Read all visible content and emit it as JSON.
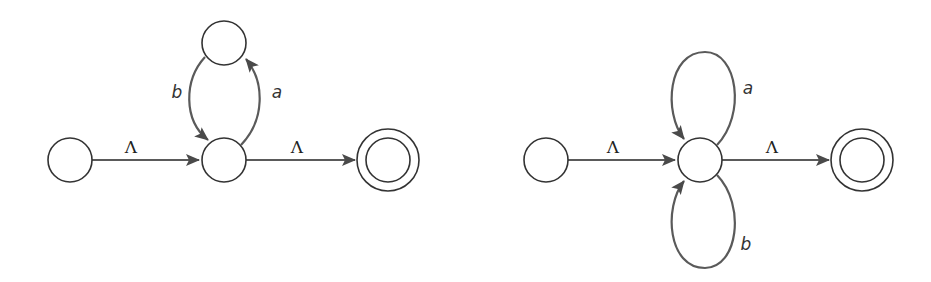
{
  "colors": {
    "state_stroke": "#333333",
    "edge_stroke": "#5a5a5a",
    "background": "#ffffff"
  },
  "diagrams": [
    {
      "name": "left-nfa",
      "states": [
        {
          "id": "start",
          "kind": "normal"
        },
        {
          "id": "middle",
          "kind": "normal"
        },
        {
          "id": "top",
          "kind": "normal"
        },
        {
          "id": "final",
          "kind": "accepting"
        }
      ],
      "edges": [
        {
          "from": "start",
          "to": "middle",
          "label": "Λ"
        },
        {
          "from": "middle",
          "to": "final",
          "label": "Λ"
        },
        {
          "from": "middle",
          "to": "top",
          "label": "a"
        },
        {
          "from": "top",
          "to": "middle",
          "label": "b"
        }
      ]
    },
    {
      "name": "right-nfa",
      "states": [
        {
          "id": "start",
          "kind": "normal"
        },
        {
          "id": "middle",
          "kind": "normal"
        },
        {
          "id": "final",
          "kind": "accepting"
        }
      ],
      "edges": [
        {
          "from": "start",
          "to": "middle",
          "label": "Λ"
        },
        {
          "from": "middle",
          "to": "final",
          "label": "Λ"
        },
        {
          "from": "middle",
          "to": "middle",
          "label": "a",
          "position": "top-loop"
        },
        {
          "from": "middle",
          "to": "middle",
          "label": "b",
          "position": "bottom-loop"
        }
      ]
    }
  ]
}
